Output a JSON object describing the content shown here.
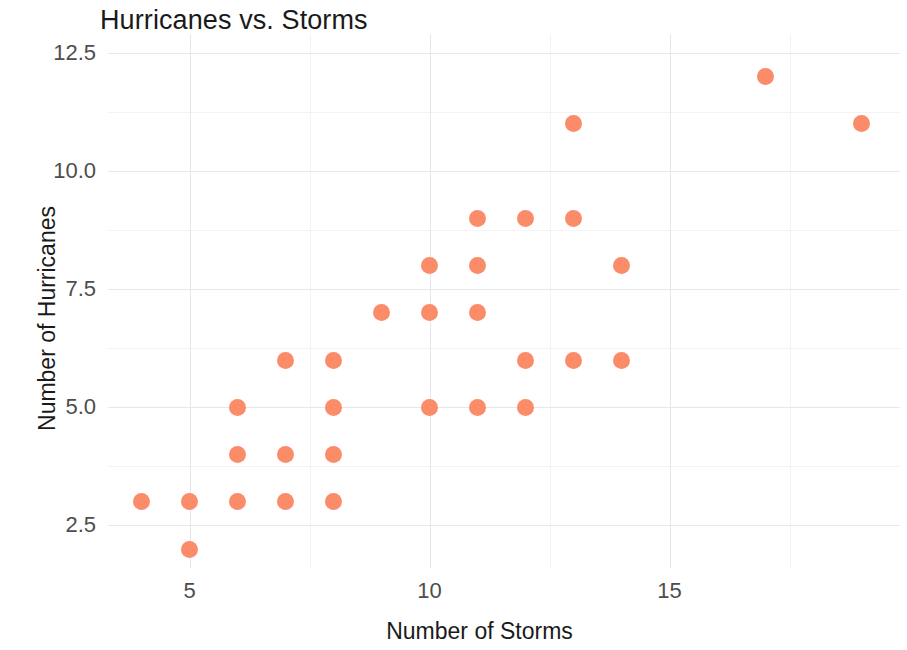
{
  "chart_data": {
    "type": "scatter",
    "title": "Hurricanes vs. Storms",
    "xlabel": "Number of Storms",
    "ylabel": "Number of Hurricanes",
    "point_color": "#fa8c69",
    "grid": true,
    "legend": null,
    "xlim": [
      3.3,
      19.8
    ],
    "ylim": [
      1.6,
      12.9
    ],
    "x_ticks": [
      {
        "value": 5,
        "label": "5"
      },
      {
        "value": 10,
        "label": "10"
      },
      {
        "value": 15,
        "label": "15"
      }
    ],
    "y_ticks": [
      {
        "value": 2.5,
        "label": "2.5"
      },
      {
        "value": 5.0,
        "label": "5.0"
      },
      {
        "value": 7.5,
        "label": "7.5"
      },
      {
        "value": 10.0,
        "label": "10.0"
      },
      {
        "value": 12.5,
        "label": "12.5"
      }
    ],
    "x_minor_gridlines": [
      7.5,
      12.5,
      17.5
    ],
    "y_minor_gridlines": [
      3.75,
      6.25,
      8.75,
      11.25
    ],
    "points": [
      {
        "x": 4,
        "y": 3
      },
      {
        "x": 5,
        "y": 3
      },
      {
        "x": 5,
        "y": 2
      },
      {
        "x": 6,
        "y": 3
      },
      {
        "x": 6,
        "y": 4
      },
      {
        "x": 6,
        "y": 5
      },
      {
        "x": 7,
        "y": 3
      },
      {
        "x": 7,
        "y": 4
      },
      {
        "x": 7,
        "y": 6
      },
      {
        "x": 8,
        "y": 3
      },
      {
        "x": 8,
        "y": 4
      },
      {
        "x": 8,
        "y": 5
      },
      {
        "x": 8,
        "y": 6
      },
      {
        "x": 9,
        "y": 7
      },
      {
        "x": 10,
        "y": 5
      },
      {
        "x": 10,
        "y": 7
      },
      {
        "x": 10,
        "y": 8
      },
      {
        "x": 11,
        "y": 5
      },
      {
        "x": 11,
        "y": 7
      },
      {
        "x": 11,
        "y": 8
      },
      {
        "x": 11,
        "y": 9
      },
      {
        "x": 12,
        "y": 5
      },
      {
        "x": 12,
        "y": 6
      },
      {
        "x": 12,
        "y": 9
      },
      {
        "x": 13,
        "y": 6
      },
      {
        "x": 13,
        "y": 9
      },
      {
        "x": 13,
        "y": 11
      },
      {
        "x": 14,
        "y": 6
      },
      {
        "x": 14,
        "y": 8
      },
      {
        "x": 17,
        "y": 12
      },
      {
        "x": 19,
        "y": 11
      }
    ]
  }
}
